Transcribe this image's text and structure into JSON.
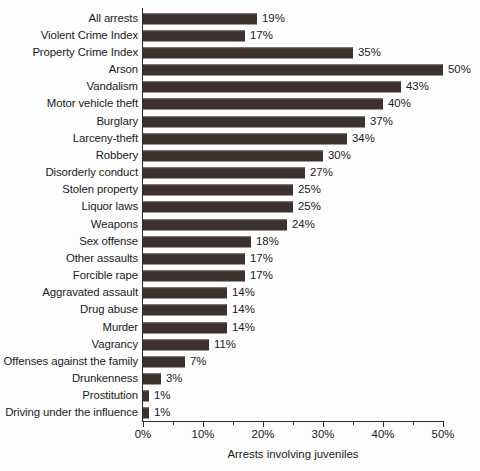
{
  "chart_data": {
    "type": "bar",
    "orientation": "horizontal",
    "title": "",
    "xlabel": "Arrests involving juveniles",
    "ylabel": "",
    "xlim": [
      0,
      50
    ],
    "xunit": "%",
    "grid": false,
    "legend": null,
    "xticks": [
      "0%",
      "10%",
      "20%",
      "30%",
      "40%",
      "50%"
    ],
    "xtick_values": [
      0,
      10,
      20,
      30,
      40,
      50
    ],
    "minor_tick_interval": 5,
    "categories": [
      "All arrests",
      "Violent Crime Index",
      "Property Crime Index",
      "Arson",
      "Vandalism",
      "Motor vehicle theft",
      "Burglary",
      "Larceny-theft",
      "Robbery",
      "Disorderly conduct",
      "Stolen property",
      "Liquor laws",
      "Weapons",
      "Sex offense",
      "Other assaults",
      "Forcible rape",
      "Aggravated assault",
      "Drug abuse",
      "Murder",
      "Vagrancy",
      "Offenses against the family",
      "Drunkenness",
      "Prostitution",
      "Driving under the influence"
    ],
    "values": [
      19,
      17,
      35,
      50,
      43,
      40,
      37,
      34,
      30,
      27,
      25,
      25,
      24,
      18,
      17,
      17,
      14,
      14,
      14,
      11,
      7,
      3,
      1,
      1
    ],
    "data_labels": [
      "19%",
      "17%",
      "35%",
      "50%",
      "43%",
      "40%",
      "37%",
      "34%",
      "30%",
      "27%",
      "25%",
      "25%",
      "24%",
      "18%",
      "17%",
      "17%",
      "14%",
      "14%",
      "14%",
      "11%",
      "7%",
      "3%",
      "1%",
      "1%"
    ],
    "bar_color": "#3b3230",
    "background_color": "#fdfdfd",
    "axis_color": "#2b2b2b"
  }
}
